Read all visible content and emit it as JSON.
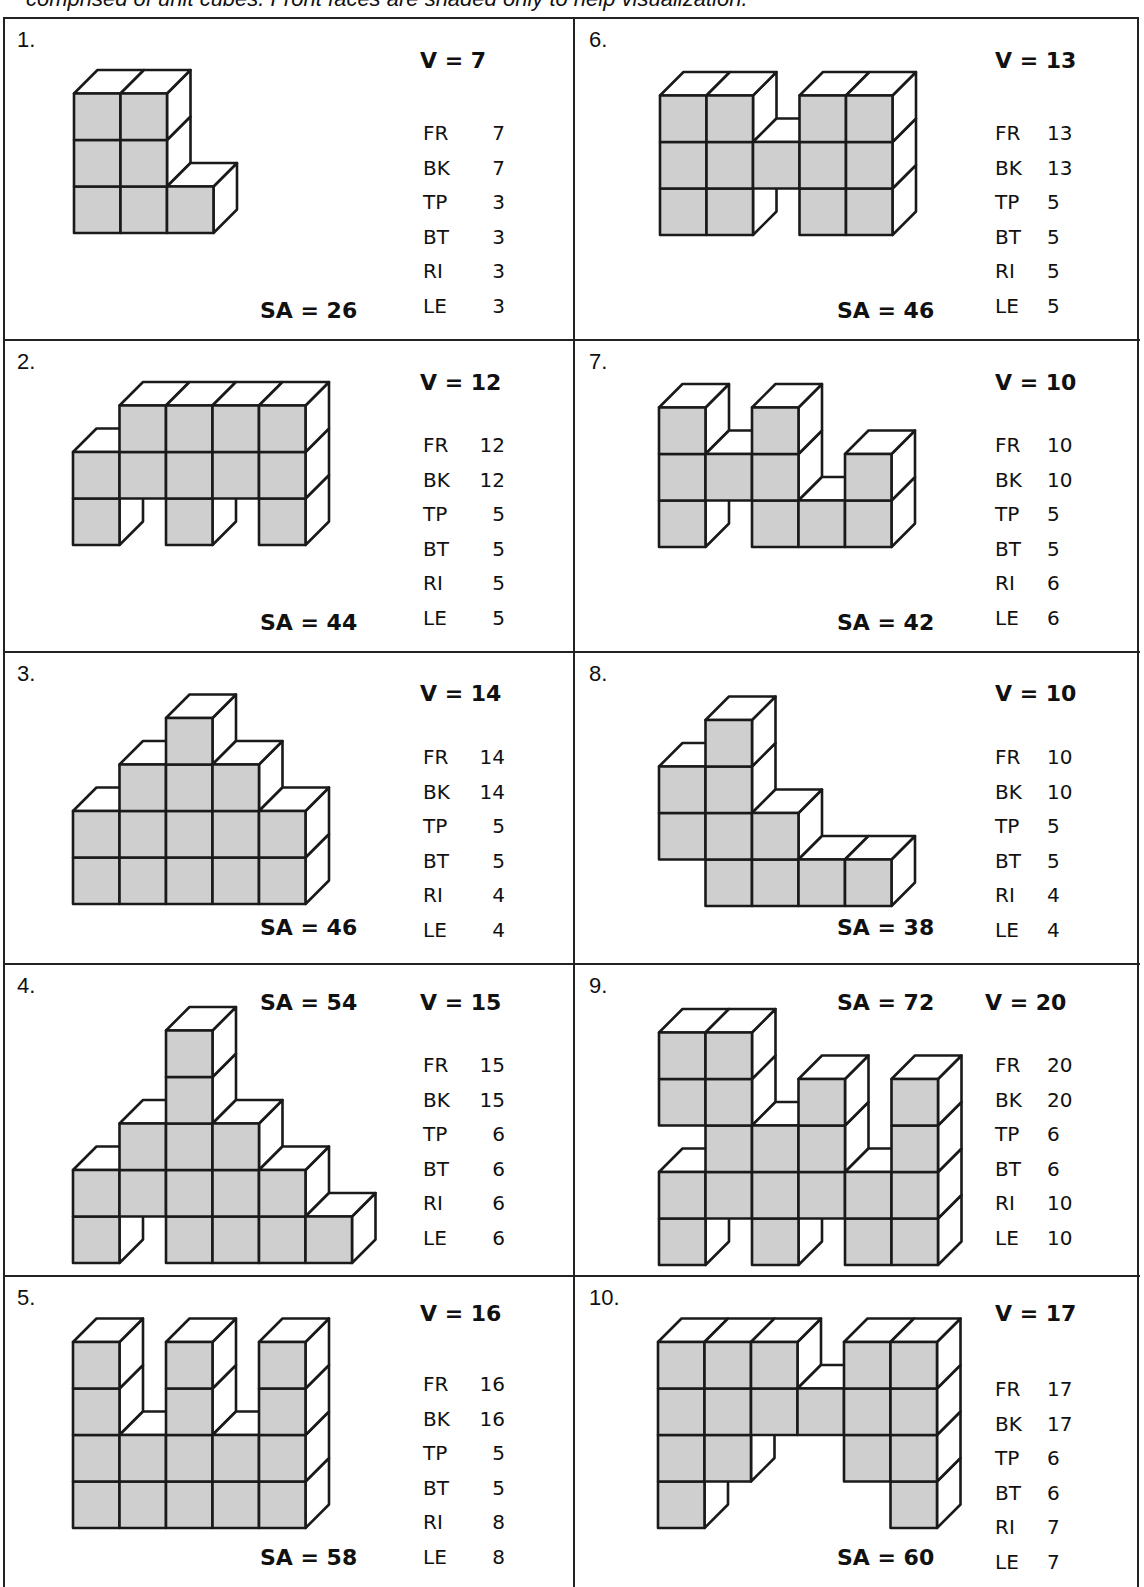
{
  "caption": "comprised of unit cubes. Front faces are shaded only to help visualization.",
  "colors": {
    "front_face": "#cfcfcf",
    "side_face": "#ffffff",
    "outline": "#1a1a1a"
  },
  "face_labels": [
    "FR",
    "BK",
    "TP",
    "BT",
    "RI",
    "LE"
  ],
  "figures": [
    {
      "number": "1.",
      "volume": "V = 7",
      "surface_area": "SA = 26",
      "faces": {
        "FR": "7",
        "BK": "7",
        "TP": "3",
        "BT": "3",
        "RI": "3",
        "LE": "3"
      },
      "cubes_by_column": [
        [
          0,
          1,
          2
        ],
        [
          0,
          1,
          2
        ],
        [
          0
        ]
      ]
    },
    {
      "number": "2.",
      "volume": "V = 12",
      "surface_area": "SA = 44",
      "faces": {
        "FR": "12",
        "BK": "12",
        "TP": "5",
        "BT": "5",
        "RI": "5",
        "LE": "5"
      },
      "cubes_by_column": [
        [
          0,
          1
        ],
        [
          1,
          2
        ],
        [
          0,
          1,
          2
        ],
        [
          1,
          2
        ],
        [
          0,
          1,
          2
        ]
      ]
    },
    {
      "number": "3.",
      "volume": "V = 14",
      "surface_area": "SA = 46",
      "faces": {
        "FR": "14",
        "BK": "14",
        "TP": "5",
        "BT": "5",
        "RI": "4",
        "LE": "4"
      },
      "cubes_by_column": [
        [
          0,
          1
        ],
        [
          0,
          1,
          2
        ],
        [
          0,
          1,
          2,
          3
        ],
        [
          0,
          1,
          2
        ],
        [
          0,
          1
        ]
      ]
    },
    {
      "number": "4.",
      "volume": "V = 15",
      "surface_area": "SA = 54",
      "faces": {
        "FR": "15",
        "BK": "15",
        "TP": "6",
        "BT": "6",
        "RI": "6",
        "LE": "6"
      },
      "cubes_by_column": [
        [
          0,
          1
        ],
        [
          1,
          2
        ],
        [
          0,
          1,
          2,
          3,
          4
        ],
        [
          0,
          1,
          2
        ],
        [
          0,
          1
        ],
        [
          0
        ]
      ]
    },
    {
      "number": "5.",
      "volume": "V = 16",
      "surface_area": "SA = 58",
      "faces": {
        "FR": "16",
        "BK": "16",
        "TP": "5",
        "BT": "5",
        "RI": "8",
        "LE": "8"
      },
      "cubes_by_column": [
        [
          0,
          1,
          2,
          3
        ],
        [
          0,
          1
        ],
        [
          0,
          1,
          2,
          3
        ],
        [
          0,
          1
        ],
        [
          0,
          1,
          2,
          3
        ]
      ]
    },
    {
      "number": "6.",
      "volume": "V = 13",
      "surface_area": "SA = 46",
      "faces": {
        "FR": "13",
        "BK": "13",
        "TP": "5",
        "BT": "5",
        "RI": "5",
        "LE": "5"
      },
      "cubes_by_column": [
        [
          0,
          1,
          2
        ],
        [
          0,
          1,
          2
        ],
        [
          1
        ],
        [
          0,
          1,
          2
        ],
        [
          0,
          1,
          2
        ]
      ]
    },
    {
      "number": "7.",
      "volume": "V = 10",
      "surface_area": "SA = 42",
      "faces": {
        "FR": "10",
        "BK": "10",
        "TP": "5",
        "BT": "5",
        "RI": "6",
        "LE": "6"
      },
      "cubes_by_column": [
        [
          0,
          1,
          2
        ],
        [
          1
        ],
        [
          0,
          1,
          2
        ],
        [
          0
        ],
        [
          0,
          1
        ]
      ]
    },
    {
      "number": "8.",
      "volume": "V = 10",
      "surface_area": "SA = 38",
      "faces": {
        "FR": "10",
        "BK": "10",
        "TP": "5",
        "BT": "5",
        "RI": "4",
        "LE": "4"
      },
      "cubes_by_column": [
        [
          1,
          2
        ],
        [
          0,
          1,
          2,
          3
        ],
        [
          0,
          1
        ],
        [
          0
        ],
        [
          0
        ]
      ]
    },
    {
      "number": "9.",
      "volume": "V = 20",
      "surface_area": "SA = 72",
      "faces": {
        "FR": "20",
        "BK": "20",
        "TP": "6",
        "BT": "6",
        "RI": "10",
        "LE": "10"
      },
      "cubes_by_column": [
        [
          0,
          1,
          3,
          4
        ],
        [
          1,
          2,
          3,
          4
        ],
        [
          0,
          1,
          2
        ],
        [
          1,
          2,
          3
        ],
        [
          0,
          1
        ],
        [
          0,
          1,
          2,
          3
        ]
      ]
    },
    {
      "number": "10.",
      "volume": "V = 17",
      "surface_area": "SA = 60",
      "faces": {
        "FR": "17",
        "BK": "17",
        "TP": "6",
        "BT": "6",
        "RI": "7",
        "LE": "7"
      },
      "cubes_by_column": [
        [
          0,
          1,
          2,
          3
        ],
        [
          1,
          2,
          3
        ],
        [
          2,
          3
        ],
        [
          2
        ],
        [
          1,
          2,
          3
        ],
        [
          0,
          1,
          2,
          3
        ]
      ]
    }
  ]
}
